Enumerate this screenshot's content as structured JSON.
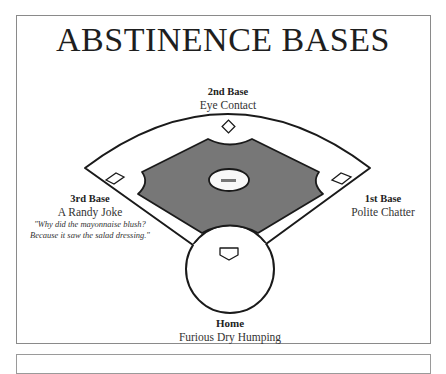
{
  "title": "ABSTINENCE BASES",
  "bases": {
    "second": {
      "name": "2nd Base",
      "activity": "Eye Contact"
    },
    "third": {
      "name": "3rd Base",
      "activity": "A Randy Joke",
      "joke_line1": "\"Why did the mayonnaise blush?",
      "joke_line2": "Because it saw the salad dressing.\""
    },
    "first": {
      "name": "1st Base",
      "activity": "Polite Chatter"
    },
    "home": {
      "name": "Home",
      "activity": "Furious Dry Humping"
    }
  },
  "colors": {
    "infield": "#777777",
    "line": "#1a1a1a",
    "frame": "#8a8a8a"
  }
}
